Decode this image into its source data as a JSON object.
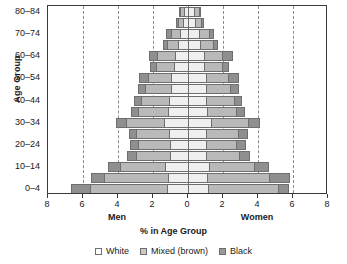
{
  "chart_data": {
    "type": "bar",
    "subtype": "population-pyramid-stacked",
    "title": "",
    "xlabel": "% in Age Group",
    "ylabel": "Age Group",
    "grid": true,
    "legend_position": "bottom",
    "axis": {
      "x_center_value": 0,
      "x_max_each_side": 8,
      "x_tick_values": [
        8,
        6,
        4,
        2,
        0,
        2,
        4,
        6,
        8
      ],
      "x_gridline_values": [
        6,
        4,
        2,
        0,
        2,
        4,
        6
      ],
      "left_side_label": "Men",
      "right_side_label": "Women"
    },
    "categories": [
      "80-84",
      "75-79",
      "70-74",
      "65-69",
      "60-64",
      "55-59",
      "50-54",
      "45-49",
      "40-44",
      "35-39",
      "30-34",
      "25-29",
      "20-24",
      "15-19",
      "10-14",
      "5-9",
      "0-4"
    ],
    "tick_categories": [
      "80-84",
      "70-74",
      "60-64",
      "50-54",
      "40-44",
      "30-34",
      "20-24",
      "10-14",
      "0-4"
    ],
    "series_names": [
      "White",
      "Mixed (brown)",
      "Black"
    ],
    "series_colors": {
      "White": "#efefef",
      "Mixed (brown)": "#b9b9b9",
      "Black": "#8f8f8f"
    },
    "men": {
      "White": [
        0.25,
        0.3,
        0.45,
        0.55,
        0.75,
        0.8,
        0.95,
        1.0,
        1.1,
        1.15,
        1.35,
        1.1,
        1.05,
        1.05,
        1.3,
        1.15,
        1.2
      ],
      "Mixed (brown)": [
        0.2,
        0.3,
        0.55,
        0.65,
        1.0,
        1.05,
        1.35,
        1.45,
        1.6,
        1.7,
        2.2,
        1.85,
        1.8,
        1.9,
        2.6,
        3.65,
        4.4
      ],
      "Black": [
        0.05,
        0.1,
        0.25,
        0.25,
        0.5,
        0.3,
        0.5,
        0.4,
        0.4,
        0.4,
        0.55,
        0.45,
        0.45,
        0.55,
        0.7,
        0.75,
        1.1
      ]
    },
    "women": {
      "White": [
        0.35,
        0.4,
        0.6,
        0.7,
        0.9,
        0.9,
        1.0,
        1.0,
        1.05,
        1.1,
        1.3,
        1.05,
        1.0,
        1.0,
        1.2,
        1.1,
        1.15
      ],
      "Mixed (brown)": [
        0.25,
        0.35,
        0.6,
        0.7,
        1.05,
        1.05,
        1.3,
        1.4,
        1.55,
        1.65,
        2.15,
        1.8,
        1.75,
        1.9,
        2.55,
        3.55,
        4.0
      ],
      "Black": [
        0.05,
        0.1,
        0.25,
        0.25,
        0.55,
        0.35,
        0.55,
        0.45,
        0.45,
        0.45,
        0.6,
        0.5,
        0.5,
        0.6,
        0.8,
        1.1,
        0.55
      ]
    }
  },
  "legend": {
    "items": [
      {
        "label": "White",
        "swatch": "white-swatch"
      },
      {
        "label": "Mixed (brown)",
        "swatch": "mixed-swatch"
      },
      {
        "label": "Black",
        "swatch": "black-swatch"
      }
    ]
  }
}
